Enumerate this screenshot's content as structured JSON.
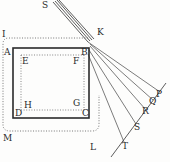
{
  "diagram": {
    "type": "geometric-optics-figure",
    "ink_color": "#2f2f2f",
    "background": "#fdfdfc",
    "labels": {
      "S_top": "S",
      "K": "K",
      "I": "I",
      "A": "A",
      "B": "B",
      "E": "E",
      "F": "F",
      "H": "H",
      "G": "G",
      "D": "D",
      "C": "C",
      "M": "M",
      "L": "L",
      "P": "P",
      "Q": "Q",
      "R": "R",
      "S_bottom": "S",
      "T": "T"
    }
  }
}
